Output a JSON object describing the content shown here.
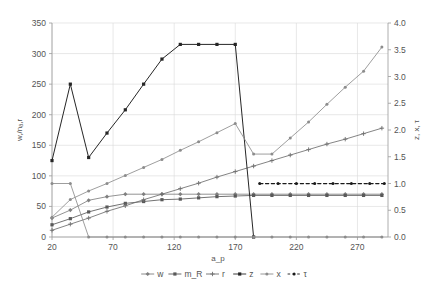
{
  "chart_data": {
    "type": "line",
    "title": "",
    "xlabel": "a_p",
    "ylabel_left": "w,/nₐ,r",
    "ylabel_right": "z, x, τ",
    "xlim": [
      20,
      295
    ],
    "ylim_left": [
      0,
      350
    ],
    "ylim_right": [
      0.0,
      4.0
    ],
    "grid": true,
    "legend_position": "bottom",
    "xticks": [
      "20",
      "70",
      "120",
      "170",
      "220",
      "270"
    ],
    "xtick_values": [
      20,
      70,
      120,
      170,
      220,
      270
    ],
    "yticks_left": [
      "0",
      "50",
      "100",
      "150",
      "200",
      "250",
      "300",
      "350"
    ],
    "ytick_values_left": [
      0,
      50,
      100,
      150,
      200,
      250,
      300,
      350
    ],
    "yticks_right": [
      "0.0",
      "0.5",
      "1.0",
      "1.5",
      "2.0",
      "2.5",
      "3.0",
      "3.5",
      "4.0"
    ],
    "ytick_values_right": [
      0.0,
      0.5,
      1.0,
      1.5,
      2.0,
      2.5,
      3.0,
      3.5,
      4.0
    ],
    "series": [
      {
        "name": "w",
        "axis": "left",
        "color": "#7f7f7f",
        "style": "solid",
        "marker": "diamond",
        "x": [
          20,
          35,
          50,
          65,
          80,
          95,
          110,
          125,
          140,
          155,
          170,
          185,
          200,
          215,
          230,
          245,
          260,
          275,
          290
        ],
        "values": [
          31,
          44,
          60,
          66,
          70,
          70,
          70,
          70,
          70,
          70,
          70,
          70,
          70,
          70,
          70,
          70,
          70,
          70,
          70
        ]
      },
      {
        "name": "m_R",
        "axis": "left",
        "color": "#595959",
        "style": "solid",
        "marker": "square",
        "x": [
          20,
          35,
          50,
          65,
          80,
          95,
          110,
          125,
          140,
          155,
          170,
          185,
          200,
          215,
          230,
          245,
          260,
          275,
          290
        ],
        "values": [
          20,
          30,
          41,
          49,
          55,
          58,
          61,
          62,
          64,
          66,
          67,
          68,
          68,
          68,
          68,
          68,
          68,
          68,
          68
        ]
      },
      {
        "name": "r",
        "axis": "left",
        "color": "#6e6e6e",
        "style": "solid",
        "marker": "plus",
        "x": [
          20,
          35,
          50,
          65,
          80,
          95,
          110,
          125,
          140,
          155,
          170,
          185,
          200,
          215,
          230,
          245,
          260,
          275,
          290
        ],
        "values": [
          11,
          21,
          31,
          42,
          51,
          61,
          70,
          79,
          88,
          98,
          107,
          116,
          125,
          134,
          143,
          152,
          160,
          169,
          178
        ]
      },
      {
        "name": "z",
        "axis": "left",
        "color": "#262626",
        "style": "solid",
        "marker": "square",
        "x": [
          20,
          35,
          50,
          65,
          80,
          95,
          110,
          125,
          140,
          155,
          170,
          185
        ],
        "values": [
          125,
          250,
          130,
          170,
          208,
          250,
          291,
          315,
          315,
          315,
          315,
          0
        ]
      },
      {
        "name": "x",
        "axis": "right",
        "color": "#8c8c8c",
        "style": "solid",
        "marker": "dot",
        "x": [
          20,
          35,
          50,
          65,
          80,
          95,
          110,
          125,
          140,
          155,
          170,
          185,
          200,
          215,
          230,
          245,
          260,
          275,
          290
        ],
        "values": [
          1.0,
          1.0,
          0.0,
          0.0,
          0.0,
          0.0,
          0.0,
          0.0,
          0.0,
          0.0,
          0.0,
          0.0,
          0.0,
          0.0,
          0.0,
          0.0,
          0.0,
          0.0,
          0.0
        ]
      },
      {
        "name": "x2",
        "axis": "right",
        "color": "#8c8c8c",
        "style": "solid",
        "marker": "dot",
        "x": [
          20,
          35,
          50,
          65,
          80,
          95,
          110,
          125,
          140,
          155,
          170,
          185,
          200,
          215,
          230,
          245,
          260,
          275,
          290
        ],
        "values": [
          0.37,
          0.7,
          0.86,
          1.0,
          1.15,
          1.3,
          1.45,
          1.62,
          1.78,
          1.95,
          2.12,
          1.55,
          1.55,
          1.85,
          2.15,
          2.48,
          2.8,
          3.1,
          3.55
        ]
      },
      {
        "name": "τ",
        "axis": "right",
        "color": "#1a1a1a",
        "style": "dashed",
        "marker": "dot",
        "x": [
          190,
          205,
          220,
          235,
          250,
          265,
          280,
          292
        ],
        "values": [
          1.0,
          1.0,
          1.0,
          1.0,
          1.0,
          1.0,
          1.0,
          1.0
        ]
      }
    ],
    "legend": [
      {
        "label": "w",
        "color": "#7f7f7f",
        "style": "solid",
        "marker": "diamond"
      },
      {
        "label": "m_R",
        "color": "#595959",
        "style": "solid",
        "marker": "square"
      },
      {
        "label": "r",
        "color": "#6e6e6e",
        "style": "solid",
        "marker": "plus"
      },
      {
        "label": "z",
        "color": "#262626",
        "style": "solid",
        "marker": "square"
      },
      {
        "label": "x",
        "color": "#8c8c8c",
        "style": "solid",
        "marker": "dot"
      },
      {
        "label": "τ",
        "color": "#1a1a1a",
        "style": "dashed",
        "marker": "dot"
      }
    ]
  }
}
